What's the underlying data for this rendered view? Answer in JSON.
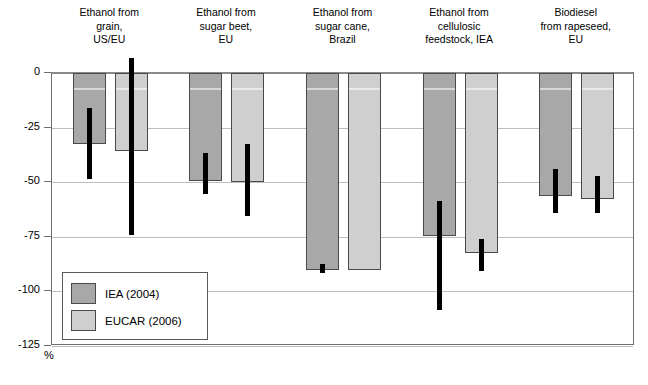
{
  "chart_data": {
    "type": "bar",
    "title": "",
    "xlabel": "",
    "ylabel": "%",
    "ylim": [
      -125,
      0
    ],
    "yticks": [
      0,
      -25,
      -50,
      -75,
      -100,
      -125
    ],
    "ytick_labels": [
      "0",
      "-25",
      "-50",
      "-75",
      "-100",
      "-125"
    ],
    "grid": true,
    "legend_position": "lower-left-inside",
    "categories": [
      "Ethanol from\ngrain,\nUS/EU",
      "Ethanol from\nsugar beet,\nEU",
      "Ethanol from\nsugar cane,\nBrazil",
      "Ethanol from\ncellulosic\nfeedstock, IEA",
      "Biodiesel\nfrom rapeseed,\nEU"
    ],
    "series": [
      {
        "name": "IEA (2004)",
        "color": "#a8a8a8",
        "values": [
          -32.5,
          -49.5,
          -90.2,
          -74.5,
          -56.5
        ],
        "err_low": [
          -48.5,
          -55.5,
          -91.5,
          -108.5,
          -64.0
        ],
        "err_high": [
          -16.0,
          -36.5,
          -87.5,
          -58.5,
          -44.0
        ]
      },
      {
        "name": "EUCAR (2006)",
        "color": "#cfcfcf",
        "values": [
          -35.5,
          -50.0,
          -90.0,
          -82.5,
          -57.5
        ],
        "err_low": [
          -74.0,
          -65.5,
          null,
          -90.5,
          -64.0
        ],
        "err_high": [
          7.0,
          -32.5,
          null,
          -76.0,
          -47.0
        ]
      }
    ]
  },
  "legend": {
    "items": [
      {
        "label": "IEA (2004)"
      },
      {
        "label": "EUCAR (2006)"
      }
    ]
  },
  "axis": {
    "unit": "%"
  }
}
